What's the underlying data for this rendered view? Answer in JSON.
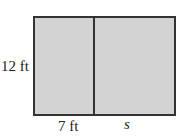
{
  "diagram": {
    "shape": "rectangle divided into two rectangles",
    "fill_color": "#d3d3d3",
    "stroke_color": "#333333",
    "labels": {
      "height": "12 ft",
      "left_width": "7 ft",
      "right_width": "s"
    }
  }
}
